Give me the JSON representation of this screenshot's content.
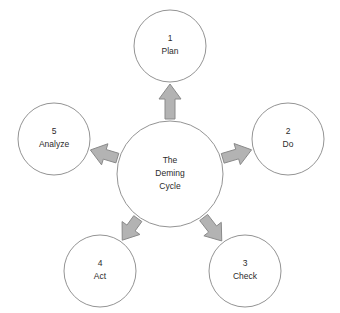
{
  "diagram": {
    "type": "radial-cycle-diagram",
    "colors": {
      "background": "#ffffff",
      "circle_fill": "#ffffff",
      "circle_stroke": "#949494",
      "arrow_fill": "#b3b3b3",
      "arrow_stroke": "#8a8a8a",
      "text": "#2b2b2b"
    },
    "center": {
      "label_line1": "The",
      "label_line2": "Deming",
      "label_line3": "Cycle",
      "cx": 170,
      "cy": 174,
      "r": 53
    },
    "nodes": [
      {
        "id": "plan",
        "number": "1",
        "label": "Plan",
        "cx": 170,
        "cy": 46,
        "r": 36,
        "angle_deg": 90
      },
      {
        "id": "do",
        "number": "2",
        "label": "Do",
        "cx": 288,
        "cy": 139,
        "r": 36,
        "angle_deg": 19
      },
      {
        "id": "check",
        "number": "3",
        "label": "Check",
        "cx": 245,
        "cy": 271,
        "r": 36,
        "angle_deg": -57
      },
      {
        "id": "act",
        "number": "4",
        "label": "Act",
        "cx": 100,
        "cy": 271,
        "r": 36,
        "angle_deg": -123
      },
      {
        "id": "analyze",
        "number": "5",
        "label": "Analyze",
        "cx": 54,
        "cy": 139,
        "r": 36,
        "angle_deg": 161
      }
    ],
    "arrows": [
      {
        "id": "arrow-to-plan",
        "from": "center",
        "to": "plan"
      },
      {
        "id": "arrow-to-do",
        "from": "center",
        "to": "do"
      },
      {
        "id": "arrow-to-check",
        "from": "center",
        "to": "check"
      },
      {
        "id": "arrow-to-act",
        "from": "center",
        "to": "act"
      },
      {
        "id": "arrow-to-analyze",
        "from": "center",
        "to": "analyze"
      }
    ]
  }
}
